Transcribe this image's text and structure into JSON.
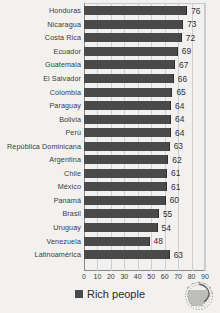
{
  "chart_data": {
    "type": "bar",
    "orientation": "horizontal",
    "title": "",
    "xlabel": "",
    "ylabel": "",
    "xlim": [
      0,
      90
    ],
    "xticks": [
      0,
      10,
      20,
      30,
      40,
      50,
      60,
      70,
      80,
      90
    ],
    "grid": true,
    "legend_position": "bottom-center",
    "series": [
      {
        "name": "Rich people",
        "color": "#4a4a4a",
        "values": [
          76,
          73,
          72,
          69,
          67,
          66,
          65,
          64,
          64,
          64,
          63,
          62,
          61,
          61,
          60,
          55,
          54,
          48,
          63
        ]
      }
    ],
    "categories": [
      "Honduras",
      "Nicaragua",
      "Costa Rica",
      "Ecuador",
      "Guatemala",
      "El Salvador",
      "Colombia",
      "Paraguay",
      "Bolivia",
      "Perú",
      "República Dominicana",
      "Argentina",
      "Chile",
      "México",
      "Panamá",
      "Brasil",
      "Uruguay",
      "Venezuela",
      "Latinoamérica"
    ]
  },
  "legend": {
    "label": "Rich people",
    "swatch_color": "#4a4a4a"
  },
  "watermark": {
    "icon": "circular-sunburst-logo"
  }
}
